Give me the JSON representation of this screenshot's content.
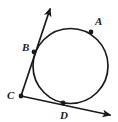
{
  "figure": {
    "name": "circle-with-two-secant-rays-from-external-point",
    "width": 118,
    "height": 122,
    "background_color": "#ffffff",
    "stroke_color": "#1a1a1a",
    "label_color": "#1a1a1a"
  },
  "circle": {
    "name": "circle",
    "cx": 70.5,
    "cy": 66,
    "r": 37.5,
    "stroke_width": 1.7,
    "fill": "none"
  },
  "points": [
    {
      "id": "A",
      "label": "A",
      "dot_x": 91,
      "dot_y": 32,
      "label_x": 95,
      "label_y": 25,
      "on_circle": true
    },
    {
      "id": "B",
      "label": "B",
      "dot_x": 34,
      "dot_y": 52,
      "label_x": 22,
      "label_y": 51,
      "on_circle": true
    },
    {
      "id": "C",
      "label": "C",
      "dot_x": 21,
      "dot_y": 96,
      "label_x": 7,
      "label_y": 99,
      "on_circle": false
    },
    {
      "id": "D",
      "label": "D",
      "dot_x": 63,
      "dot_y": 103,
      "label_x": 60,
      "label_y": 119,
      "on_circle": true
    }
  ],
  "dot_radius": 2.4,
  "rays": [
    {
      "id": "ray-C-B",
      "from": "C",
      "through": "B",
      "x1": 21,
      "y1": 96,
      "x2": 50,
      "y2": 9,
      "stroke_width": 1.7,
      "arrowhead": "end"
    },
    {
      "id": "ray-C-D",
      "from": "C",
      "through": "D",
      "x1": 21,
      "y1": 96,
      "x2": 110,
      "y2": 115,
      "stroke_width": 1.7,
      "arrowhead": "end"
    }
  ]
}
